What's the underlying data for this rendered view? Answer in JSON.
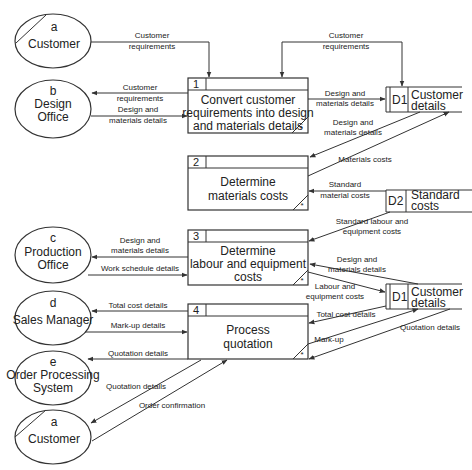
{
  "entities": [
    {
      "id": "a",
      "name": "Customer"
    },
    {
      "id": "b",
      "name_line1": "Design",
      "name_line2": "Office"
    },
    {
      "id": "c",
      "name_line1": "Production",
      "name_line2": "Office"
    },
    {
      "id": "d",
      "name": "Sales Manager"
    },
    {
      "id": "e",
      "name_line1": "Order Processing",
      "name_line2": "System"
    },
    {
      "id": "a",
      "name": "Customer"
    }
  ],
  "processes": [
    {
      "num": "1",
      "line1": "Convert customer",
      "line2": "requirements into design",
      "line3": "and materials details",
      "mark": "*"
    },
    {
      "num": "2",
      "line1": "Determine",
      "line2": "materials costs",
      "mark": "*"
    },
    {
      "num": "3",
      "line1": "Determine",
      "line2": "labour and  equipment",
      "line3": "costs",
      "mark": "*"
    },
    {
      "num": "4",
      "line1": "Process",
      "line2": "quotation",
      "mark": "*"
    }
  ],
  "stores": [
    {
      "id": "D1",
      "line1": "Customer",
      "line2": "details"
    },
    {
      "id": "D2",
      "line1": "Standard",
      "line2": "costs"
    },
    {
      "id": "D1",
      "line1": "Customer",
      "line2": "details"
    }
  ],
  "flows": {
    "f1": [
      "Customer",
      "requirements"
    ],
    "f2": [
      "Customer",
      "requirements"
    ],
    "f3": [
      "Customer",
      "requirements"
    ],
    "f4": [
      "Design and",
      "materials details"
    ],
    "f5": [
      "Design and",
      "materials details"
    ],
    "f6": [
      "Design and",
      "materials details"
    ],
    "f7": [
      "Materials costs"
    ],
    "f8": [
      "Standard",
      "material costs"
    ],
    "f9": [
      "Standard labour and",
      "equipment costs"
    ],
    "f10": [
      "Design and",
      "materials details"
    ],
    "f11": [
      "Work schedule details"
    ],
    "f12": [
      "Design and",
      "materials details"
    ],
    "f13": [
      "Labour and",
      "equipment costs"
    ],
    "f14": [
      "Total cost details"
    ],
    "f15": [
      "Mark-up details"
    ],
    "f16": [
      "Total cost details"
    ],
    "f17": [
      "Mark-up"
    ],
    "f18": [
      "Quotation details"
    ],
    "f19": [
      "Quotation details"
    ],
    "f20": [
      "Quotation details"
    ],
    "f21": [
      "Order confirmation"
    ]
  }
}
